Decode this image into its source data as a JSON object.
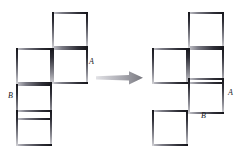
{
  "figure": {
    "background_color": "#ffffff",
    "width": 244,
    "height": 159,
    "stroke_dark": "#15151a",
    "stroke_light": "#d2d2d6",
    "arrow_color_start": "#d9d9dd",
    "arrow_color_end": "#808089"
  },
  "left_shape": {
    "name": "source-shape",
    "cell_size": 36,
    "origin_x": 16,
    "origin_y": 12,
    "squares": [
      {
        "id": "L1",
        "col": 1,
        "row": 0
      },
      {
        "id": "L2",
        "col": 0,
        "row": 1
      },
      {
        "id": "L3",
        "col": 1,
        "row": 1
      },
      {
        "id": "L4",
        "col": 0,
        "row": 2
      },
      {
        "id": "L5",
        "col": 0,
        "row": 3
      }
    ],
    "labels": [
      {
        "id": "left-label-a",
        "text": "A",
        "x": 89,
        "y": 58
      },
      {
        "id": "left-label-b",
        "text": "B",
        "x": 8,
        "y": 92
      }
    ]
  },
  "right_shape": {
    "name": "target-shape",
    "cell_size": 36,
    "origin_x": 152,
    "origin_y": 12,
    "squares": [
      {
        "id": "R1",
        "col": 1,
        "row": 0
      },
      {
        "id": "R2",
        "col": 0,
        "row": 1
      },
      {
        "id": "R3",
        "col": 1,
        "row": 1
      },
      {
        "id": "R4",
        "col": 1,
        "row": 2
      },
      {
        "id": "R5",
        "col": 0,
        "row": 3
      }
    ],
    "labels": [
      {
        "id": "right-label-a",
        "text": "A",
        "x": 228,
        "y": 89
      },
      {
        "id": "right-label-b",
        "text": "B",
        "x": 201,
        "y": 112
      }
    ]
  },
  "arrow": {
    "name": "transform-arrow",
    "x": 96,
    "y": 70,
    "width": 48,
    "height": 16,
    "direction": "right"
  }
}
